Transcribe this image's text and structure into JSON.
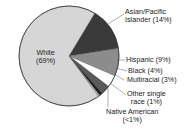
{
  "chart_data": {
    "type": "pie",
    "title": "",
    "slices": [
      {
        "label": "White",
        "value": 69,
        "display": "(69%)",
        "color": "#d6d6d6"
      },
      {
        "label": "Asian/Pacific Islander",
        "value": 14,
        "display": "(14%)",
        "color": "#3a3a3a"
      },
      {
        "label": "Hispanic",
        "value": 9,
        "display": "(9%)",
        "color": "#8c8c8c"
      },
      {
        "label": "Black",
        "value": 4,
        "display": "(4%)",
        "color": "#ffffff"
      },
      {
        "label": "Multiracial",
        "value": 3,
        "display": "(3%)",
        "color": "#5a5a5a"
      },
      {
        "label": "Other single race",
        "value": 1,
        "display": "(1%)",
        "color": "#1a1a1a"
      },
      {
        "label": "Native American",
        "value": 0.5,
        "display": "(<1%)",
        "color": "#bdbdbd"
      }
    ]
  },
  "labels": {
    "white_1": "White",
    "white_2": "(69%)",
    "asian_1": "Asian/Pacific",
    "asian_2": "Islander (14%)",
    "hispanic": "Hispanic (9%)",
    "black": "Black (4%)",
    "multiracial": "Multiracial (3%)",
    "other_1": "Other single",
    "other_2": "race (1%)",
    "native_1": "Native American",
    "native_2": "(<1%)"
  }
}
